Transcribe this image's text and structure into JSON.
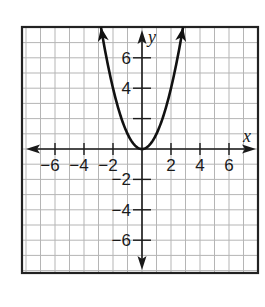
{
  "chart_data": {
    "type": "line",
    "title": "",
    "function": "y = x^2",
    "xlabel": "x",
    "ylabel": "y",
    "xlim": [
      -8.3,
      8.1
    ],
    "ylim": [
      -8.1,
      8.0
    ],
    "grid": true,
    "grid_step": 1,
    "x_ticks": [
      -6,
      -4,
      -2,
      2,
      4,
      6
    ],
    "y_ticks": [
      6,
      4,
      2,
      -2,
      -4,
      -6
    ],
    "x_tick_labels": [
      "−6",
      "−4",
      "−2",
      "2",
      "4",
      "6"
    ],
    "y_tick_labels": [
      "6",
      "4",
      "",
      "−2",
      "−4",
      "−6"
    ],
    "series": [
      {
        "name": "y = x^2",
        "x": [
          -2.83,
          -2.5,
          -2,
          -1.5,
          -1,
          -0.5,
          0,
          0.5,
          1,
          1.5,
          2,
          2.5,
          2.83
        ],
        "values": [
          8.0,
          6.25,
          4,
          2.25,
          1,
          0.25,
          0,
          0.25,
          1,
          2.25,
          4,
          6.25,
          8.0
        ],
        "arrows_at_ends": true
      }
    ],
    "legend": null
  },
  "layout": {
    "origin_px": [
      142,
      149
    ],
    "unit_px_x": 14.5,
    "unit_px_y": 15.2,
    "frame": {
      "x0": 22,
      "y0": 27,
      "x1": 258,
      "y1": 273
    },
    "colors": {
      "grid": "#b5b5b5",
      "axis": "#1a1a1a",
      "curve": "#111111",
      "frame": "#222222",
      "background": "#ffffff"
    }
  }
}
